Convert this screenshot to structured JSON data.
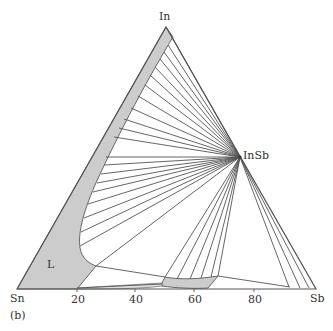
{
  "figure": {
    "panel_label": "(b)",
    "vertices": {
      "top": "In",
      "left": "Sn",
      "right": "Sb"
    },
    "compound_label": "InSb",
    "region_label": "L",
    "bottom_axis_ticks": [
      "20",
      "40",
      "60",
      "80"
    ],
    "colors": {
      "region_fill": "#cccccc",
      "line": "#555555",
      "background": "#ffffff"
    }
  }
}
